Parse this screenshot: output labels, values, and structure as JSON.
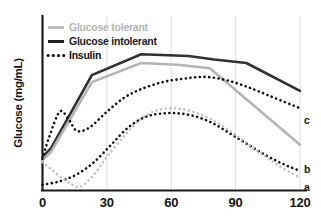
{
  "chart_data": {
    "type": "line",
    "title": "",
    "xlabel": "",
    "ylabel": "Glucose (mg/mL)",
    "xlim": [
      0,
      120
    ],
    "ylim": [
      0,
      100
    ],
    "xticks": [
      0,
      30,
      60,
      90,
      120
    ],
    "xtick_labels": [
      "0",
      "30",
      "60",
      "90",
      "120"
    ],
    "yticks": [],
    "ytick_labels": [],
    "grid": "vertical",
    "legend_position": "top-left",
    "legend": [
      {
        "key": "glucose_tolerant",
        "label": "Glucose tolerant",
        "style": "solid",
        "color": "#b4b4b4"
      },
      {
        "key": "glucose_intolerant",
        "label": "Glucose intolerant",
        "style": "solid",
        "color": "#303030"
      },
      {
        "key": "insulin",
        "label": "Insulin",
        "style": "dotted",
        "color": "#111111"
      }
    ],
    "annotations": [
      {
        "text": "c",
        "x": 120,
        "y": 40,
        "series": "insulin_intolerant"
      },
      {
        "text": "b",
        "x": 120,
        "y": 12,
        "series": "insulin_tolerant_dark"
      },
      {
        "text": "a",
        "x": 120,
        "y": 2,
        "series": "insulin_tolerant_light"
      }
    ],
    "series": [
      {
        "name": "Glucose intolerant",
        "key": "glucose_intolerant",
        "style": "solid",
        "color": "#303030",
        "width": 2.6,
        "x": [
          0,
          4,
          23,
          46,
          68,
          80,
          95,
          120
        ],
        "values": [
          19,
          24,
          66,
          78,
          77,
          75,
          73,
          57
        ]
      },
      {
        "name": "Glucose tolerant",
        "key": "glucose_tolerant",
        "style": "solid",
        "color": "#b4b4b4",
        "width": 2.6,
        "x": [
          0,
          4,
          23,
          46,
          63,
          78,
          120
        ],
        "values": [
          17,
          22,
          62,
          73,
          72,
          70,
          26
        ]
      },
      {
        "name": "Insulin c",
        "key": "insulin_intolerant",
        "style": "dotted",
        "color": "#111111",
        "width": 2.6,
        "x": [
          0,
          3,
          8,
          12,
          16,
          22,
          30,
          38,
          46,
          56,
          66,
          76,
          86,
          96,
          106,
          116,
          120
        ],
        "values": [
          18,
          30,
          45,
          41,
          34,
          36,
          45,
          53,
          58,
          62,
          64,
          65,
          63,
          59,
          54,
          49,
          47
        ]
      },
      {
        "name": "Insulin b",
        "key": "insulin_tolerant_dark",
        "style": "dotted",
        "color": "#111111",
        "width": 2.6,
        "x": [
          0,
          8,
          16,
          24,
          32,
          40,
          48,
          56,
          64,
          72,
          80,
          88,
          96,
          104,
          112,
          120
        ],
        "values": [
          3,
          5,
          9,
          16,
          26,
          36,
          42,
          44,
          44,
          42,
          38,
          32,
          26,
          20,
          15,
          11
        ]
      },
      {
        "name": "Insulin a",
        "key": "insulin_tolerant_light",
        "style": "dotted",
        "color": "#c2c2c2",
        "width": 2.6,
        "x": [
          0,
          4,
          9,
          14,
          18,
          24,
          30,
          38,
          46,
          54,
          62,
          70,
          78,
          86,
          94,
          102,
          110,
          120
        ],
        "values": [
          16,
          12,
          7,
          3,
          2,
          9,
          19,
          31,
          41,
          46,
          47,
          45,
          41,
          35,
          28,
          21,
          14,
          7
        ]
      }
    ]
  }
}
